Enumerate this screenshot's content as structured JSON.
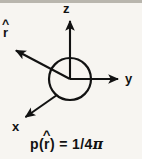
{
  "figure": {
    "background_color": "#f7f5f1",
    "ink_color": "#121212",
    "width": 142,
    "height": 159
  },
  "axes": [
    {
      "key": "z",
      "label": "z",
      "direction": "up",
      "arrow_tip": {
        "x": 70,
        "y": 18
      },
      "origin": {
        "x": 70,
        "y": 79
      }
    },
    {
      "key": "y",
      "label": "y",
      "direction": "right",
      "arrow_tip": {
        "x": 122,
        "y": 79
      },
      "origin": {
        "x": 70,
        "y": 79
      }
    },
    {
      "key": "x",
      "label": "x",
      "direction": "down-left",
      "arrow_tip": {
        "x": 22,
        "y": 120
      },
      "origin": {
        "x": 70,
        "y": 79
      }
    }
  ],
  "vector": {
    "key": "r-hat",
    "base_symbol": "r",
    "accent": "^",
    "label": "r̂",
    "direction": "up-left",
    "arrow_tip": {
      "x": 12,
      "y": 48
    },
    "origin": {
      "x": 70,
      "y": 79
    }
  },
  "sphere": {
    "name": "unit-sphere",
    "center": {
      "x": 70,
      "y": 79
    },
    "radius": 21,
    "filled": false
  },
  "equation": {
    "full_text": "p(r̂) = 1/4π",
    "function_name": "p",
    "open_paren": "(",
    "argument_base": "r",
    "argument_accent": "^",
    "close_paren": ")",
    "equals": "=",
    "value": "1/4",
    "pi_symbol": "π"
  }
}
